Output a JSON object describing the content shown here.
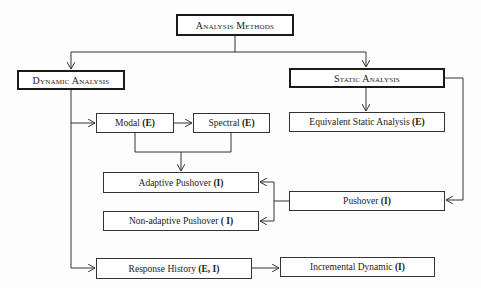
{
  "diagram": {
    "root": {
      "label": "Analysis Methods"
    },
    "branches": {
      "dynamic": {
        "label": "Dynamic Analysis"
      },
      "static": {
        "label": "Static Analysis"
      }
    },
    "nodes": {
      "modal": {
        "label": "Modal",
        "tag": "(E)"
      },
      "spectral": {
        "label": "Spectral",
        "tag": "(E)"
      },
      "equivalent_static": {
        "label": "Equivalent Static Analysis",
        "tag": "(E)"
      },
      "adaptive_pushover": {
        "label": "Adaptive Pushover",
        "tag": "(I)"
      },
      "non_adaptive_pushover": {
        "label": "Non-adaptive Pushover",
        "tag": "( I)"
      },
      "pushover": {
        "label": "Pushover",
        "tag": "(I)"
      },
      "response_history": {
        "label": "Response History",
        "tag": "(E, I)"
      },
      "incremental_dynamic": {
        "label": "Incremental Dynamic",
        "tag": "(I)"
      }
    },
    "edges": [
      {
        "from": "Analysis Methods",
        "to": "Dynamic Analysis"
      },
      {
        "from": "Analysis Methods",
        "to": "Static Analysis"
      },
      {
        "from": "Dynamic Analysis",
        "to": "Modal"
      },
      {
        "from": "Modal",
        "to": "Spectral"
      },
      {
        "from": "Modal + Spectral",
        "to": "Adaptive Pushover"
      },
      {
        "from": "Dynamic Analysis",
        "to": "Response History"
      },
      {
        "from": "Response History",
        "to": "Incremental Dynamic"
      },
      {
        "from": "Static Analysis",
        "to": "Equivalent Static Analysis"
      },
      {
        "from": "Static Analysis",
        "to": "Pushover"
      },
      {
        "from": "Pushover",
        "to": "Adaptive Pushover"
      },
      {
        "from": "Pushover",
        "to": "Non-adaptive Pushover"
      }
    ],
    "colors": {
      "line": "#333333",
      "box_border": "#333333",
      "background": "#ffffff"
    }
  }
}
